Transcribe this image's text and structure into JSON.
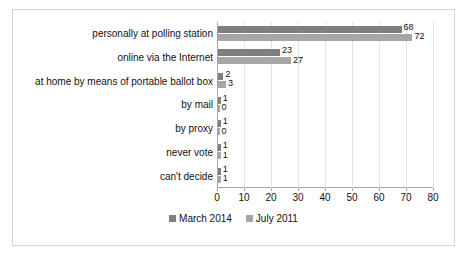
{
  "chart_data": {
    "type": "bar",
    "orientation": "horizontal",
    "title": "",
    "xlabel": "",
    "ylabel": "",
    "xlim": [
      0,
      80
    ],
    "xticks": [
      0,
      10,
      20,
      30,
      40,
      50,
      60,
      70,
      80
    ],
    "grid": true,
    "legend_position": "bottom",
    "categories": [
      "personally at polling station",
      "online via the Internet",
      "at home by means of portable ballot box",
      "by mail",
      "by proxy",
      "never vote",
      "can't decide"
    ],
    "series": [
      {
        "name": "March 2014",
        "color": "#7f7f7f",
        "values": [
          68,
          23,
          2,
          1,
          1,
          1,
          1
        ]
      },
      {
        "name": "July 2011",
        "color": "#a6a6a6",
        "values": [
          72,
          27,
          3,
          0,
          0,
          1,
          1
        ]
      }
    ]
  },
  "legend": {
    "items": [
      {
        "label": "March 2014",
        "color": "#7f7f7f"
      },
      {
        "label": "July 2011",
        "color": "#a6a6a6"
      }
    ]
  },
  "colors": {
    "series_march_2014": "#7f7f7f",
    "series_july_2011": "#a6a6a6",
    "gridline": "#e3e3e3",
    "axis": "#a6a6a6",
    "frame": "#d4d4d4",
    "text": "#111111",
    "background": "#ffffff"
  }
}
